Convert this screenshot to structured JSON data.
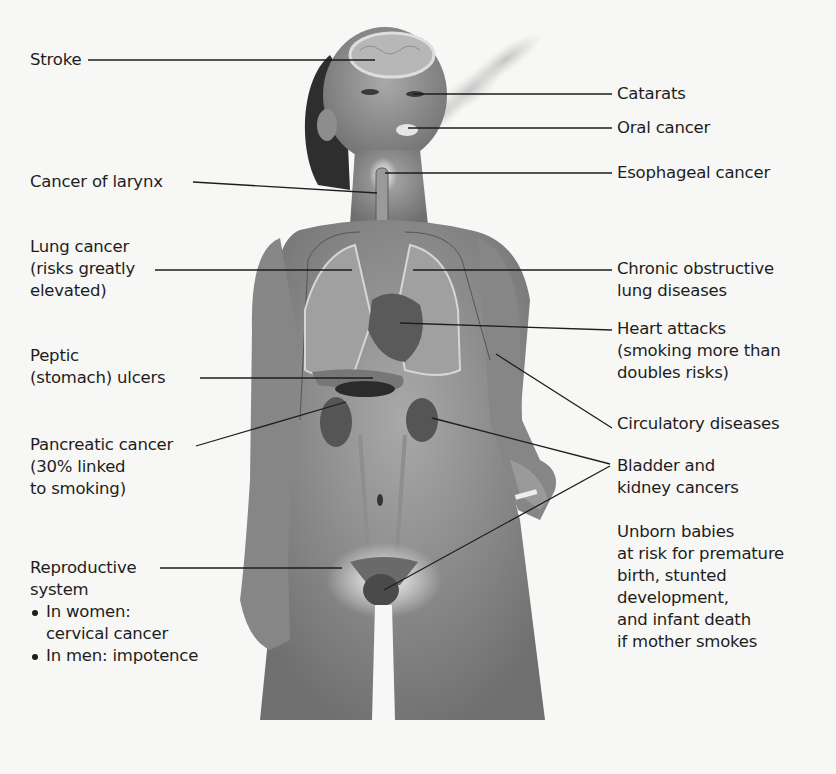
{
  "figure": {
    "colors": {
      "background": "#f7f7f5",
      "body_skin": "#8a8a8a",
      "organ_dark": "#4a4a4a",
      "leader_line": "#1d1d1d",
      "text": "#1d1d1d"
    }
  },
  "labels_left": [
    {
      "id": "stroke",
      "lines": [
        "Stroke"
      ]
    },
    {
      "id": "larynx",
      "lines": [
        "Cancer of larynx"
      ]
    },
    {
      "id": "lung-cancer",
      "lines": [
        "Lung cancer",
        "(risks greatly",
        "elevated)"
      ]
    },
    {
      "id": "peptic",
      "lines": [
        "Peptic",
        "(stomach) ulcers"
      ]
    },
    {
      "id": "pancreatic",
      "lines": [
        "Pancreatic cancer",
        "(30% linked",
        "to smoking)"
      ]
    },
    {
      "id": "reproductive",
      "lines": [
        "Reproductive",
        "system"
      ],
      "bullets": [
        {
          "lines": [
            "In women:",
            "cervical cancer"
          ]
        },
        {
          "lines": [
            "In men: impotence"
          ]
        }
      ]
    }
  ],
  "labels_right": [
    {
      "id": "cataracts",
      "lines": [
        "Catarats"
      ]
    },
    {
      "id": "oral",
      "lines": [
        "Oral cancer"
      ]
    },
    {
      "id": "esophageal",
      "lines": [
        "Esophageal cancer"
      ]
    },
    {
      "id": "copd",
      "lines": [
        "Chronic obstructive",
        "lung diseases"
      ]
    },
    {
      "id": "heart",
      "lines": [
        "Heart attacks",
        "(smoking more than",
        "doubles risks)"
      ]
    },
    {
      "id": "circulatory",
      "lines": [
        "Circulatory diseases"
      ]
    },
    {
      "id": "bladder-kidney",
      "lines": [
        "Bladder and",
        "kidney cancers"
      ]
    },
    {
      "id": "unborn",
      "lines": [
        "Unborn babies",
        "at risk for premature",
        "birth, stunted",
        "development,",
        "and infant death",
        "if mother smokes"
      ]
    }
  ]
}
